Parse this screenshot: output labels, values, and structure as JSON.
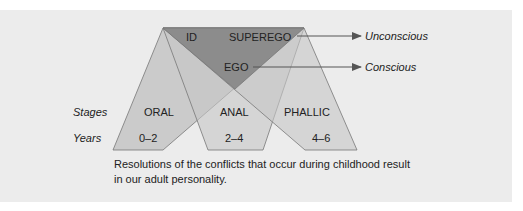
{
  "diagram": {
    "structures": {
      "id": "ID",
      "superego": "SUPEREGO",
      "ego": "EGO"
    },
    "levels": {
      "unconscious": "Unconscious",
      "conscious": "Conscious"
    },
    "row_labels": {
      "stages": "Stages",
      "years": "Years"
    },
    "stages": [
      {
        "name": "ORAL",
        "years": "0–2"
      },
      {
        "name": "ANAL",
        "years": "2–4"
      },
      {
        "name": "PHALLIC",
        "years": "4–6"
      }
    ],
    "caption": "Resolutions of the conflicts that occur during childhood result in our adult personality.",
    "colors": {
      "background": "#ececec",
      "stage_fill": "#c6c6c6",
      "overlap_fill": "#adadad",
      "personality_triangle": "#8c8c8c",
      "stroke": "#777777",
      "arrow": "#555555"
    }
  }
}
